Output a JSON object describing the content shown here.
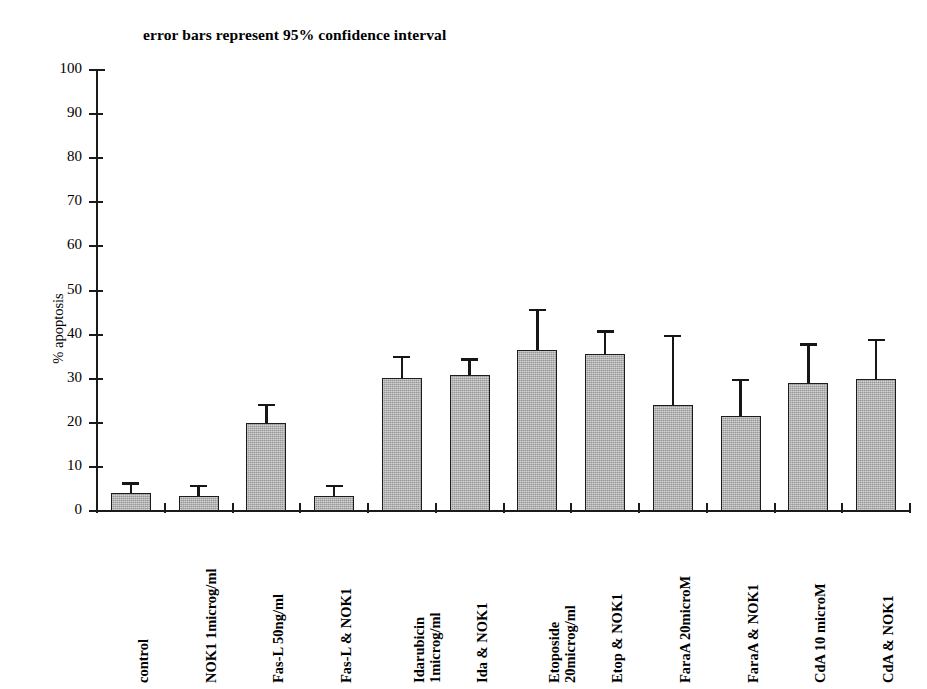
{
  "chart_data": {
    "type": "bar",
    "title": "error bars represent 95% confidence interval",
    "xlabel": "",
    "ylabel": "% apoptosis",
    "ylim": [
      0,
      100
    ],
    "yticks": [
      0,
      10,
      20,
      30,
      40,
      50,
      60,
      70,
      80,
      90,
      100
    ],
    "grid": false,
    "legend": "none",
    "error_bar_type": "95% confidence interval",
    "categories": [
      "control",
      "NOK1 1microg/ml",
      "Fas-L 50ng/ml",
      "Fas-L & NOK1",
      "Idarubicin 1microg/ml",
      "Ida & NOK1",
      "Etoposide 20microg/ml",
      "Etop & NOK1",
      "FaraA 20microM",
      "FaraA & NOK1",
      "CdA 10 microM",
      "CdA & NOK1"
    ],
    "category_lines": [
      [
        "control",
        ""
      ],
      [
        "NOK1 1microg/ml",
        ""
      ],
      [
        "Fas-L 50ng/ml",
        ""
      ],
      [
        "Fas-L & NOK1",
        ""
      ],
      [
        "Idarubicin",
        "1microg/ml"
      ],
      [
        "Ida & NOK1",
        ""
      ],
      [
        "Etoposide",
        "20microg/ml"
      ],
      [
        "Etop & NOK1",
        ""
      ],
      [
        "FaraA 20microM",
        ""
      ],
      [
        "FaraA & NOK1",
        ""
      ],
      [
        "CdA 10 microM",
        ""
      ],
      [
        "CdA & NOK1",
        ""
      ]
    ],
    "values": [
      4.0,
      3.5,
      20.0,
      3.5,
      30.2,
      30.8,
      36.5,
      35.6,
      24.0,
      21.5,
      29.0,
      30.0
    ],
    "error_upper": [
      6.5,
      6.0,
      24.3,
      6.0,
      35.2,
      34.6,
      45.8,
      41.0,
      40.0,
      30.0,
      38.0,
      39.0
    ],
    "error_lower": [
      4.0,
      3.5,
      20.0,
      3.5,
      30.2,
      30.8,
      36.5,
      35.6,
      24.0,
      21.5,
      29.0,
      30.0
    ],
    "bar_color": "#a9a9a9",
    "bar_edge_color": "#1c1c1c",
    "axis_color": "#1a1a1a"
  }
}
